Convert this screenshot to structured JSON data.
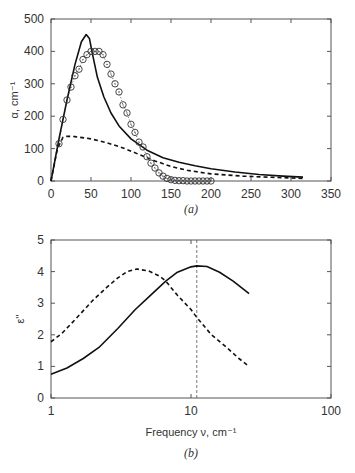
{
  "chart_data": [
    {
      "id": "a",
      "type": "line",
      "panel_label": "(a)",
      "xlabel": "",
      "ylabel": "α, cm⁻¹",
      "xlim": [
        0,
        350
      ],
      "ylim": [
        0,
        500
      ],
      "xticks": [
        0,
        50,
        100,
        150,
        200,
        250,
        300,
        350
      ],
      "yticks": [
        0,
        100,
        200,
        300,
        400,
        500
      ],
      "grid": false,
      "series": [
        {
          "name": "solid",
          "style": "solid",
          "x": [
            0,
            10,
            20,
            30,
            38,
            44,
            48,
            52,
            58,
            66,
            75,
            85,
            100,
            120,
            140,
            160,
            180,
            200,
            230,
            260,
            290,
            315
          ],
          "y": [
            0,
            130,
            250,
            360,
            430,
            452,
            440,
            390,
            320,
            260,
            210,
            170,
            130,
            95,
            72,
            58,
            47,
            38,
            28,
            20,
            15,
            12
          ]
        },
        {
          "name": "dashed",
          "style": "dashed",
          "x": [
            0,
            8,
            15,
            20,
            30,
            50,
            70,
            90,
            110,
            130,
            150,
            170,
            200,
            240,
            280,
            315
          ],
          "y": [
            0,
            100,
            135,
            138,
            137,
            130,
            118,
            102,
            82,
            62,
            45,
            33,
            22,
            15,
            11,
            8
          ]
        },
        {
          "name": "experimental",
          "style": "circles",
          "x": [
            10,
            15,
            20,
            25,
            30,
            35,
            40,
            45,
            50,
            55,
            60,
            65,
            70,
            75,
            80,
            85,
            90,
            95,
            100,
            105,
            110,
            115,
            120,
            125,
            130,
            135,
            140,
            145,
            150,
            155,
            160,
            165,
            170,
            175,
            180,
            185,
            190,
            195,
            200
          ],
          "y": [
            115,
            190,
            250,
            290,
            325,
            345,
            375,
            390,
            400,
            400,
            400,
            390,
            360,
            330,
            300,
            275,
            235,
            210,
            175,
            150,
            120,
            105,
            75,
            55,
            40,
            25,
            15,
            8,
            4,
            2,
            1,
            1,
            0,
            0,
            0,
            0,
            0,
            0,
            0
          ]
        }
      ]
    },
    {
      "id": "b",
      "type": "line",
      "panel_label": "(b)",
      "xlabel": "Frequency ν, cm⁻¹",
      "ylabel": "ε''",
      "xscale": "log",
      "xlim": [
        1,
        100
      ],
      "ylim": [
        0,
        5
      ],
      "xticks": [
        1,
        10,
        100
      ],
      "yticks": [
        0,
        1,
        2,
        3,
        4,
        5
      ],
      "grid": false,
      "vline": 11,
      "series": [
        {
          "name": "solid",
          "style": "solid",
          "x": [
            1,
            1.3,
            1.7,
            2.2,
            3,
            4,
            5,
            6.6,
            8,
            10,
            11,
            13,
            16,
            20,
            26
          ],
          "y": [
            0.75,
            0.95,
            1.25,
            1.6,
            2.2,
            2.8,
            3.2,
            3.7,
            3.98,
            4.15,
            4.18,
            4.16,
            3.98,
            3.7,
            3.3
          ]
        },
        {
          "name": "dashed",
          "style": "dashed",
          "x": [
            1,
            1.2,
            1.5,
            2,
            2.5,
            3,
            3.5,
            4.1,
            5,
            6,
            6.6,
            8,
            10,
            11,
            14,
            18,
            22,
            26
          ],
          "y": [
            1.78,
            2.05,
            2.5,
            3.1,
            3.5,
            3.8,
            4.0,
            4.08,
            4.02,
            3.85,
            3.7,
            3.25,
            2.8,
            2.55,
            2.0,
            1.6,
            1.25,
            1.0
          ]
        }
      ]
    }
  ],
  "labels": {
    "a_ylabel": "α, cm⁻¹",
    "a_panel": "(a)",
    "b_ylabel": "ε''",
    "b_xlabel": "Frequency ν, cm⁻¹",
    "b_panel": "(b)"
  }
}
